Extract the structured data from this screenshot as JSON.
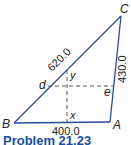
{
  "diagram": {
    "vertices": {
      "A": {
        "label": "A"
      },
      "B": {
        "label": "B"
      },
      "C": {
        "label": "C"
      }
    },
    "points": {
      "d": {
        "label": "d"
      },
      "e": {
        "label": "e"
      },
      "x": {
        "label": "x"
      },
      "y": {
        "label": "y"
      }
    },
    "sides": {
      "BC": {
        "length": "620.0"
      },
      "CA": {
        "length": "430.0"
      },
      "BA": {
        "length": "400.0"
      }
    },
    "colors": {
      "line": "#2a4a9a",
      "dashed": "#555555",
      "caption": "#1a4fa0"
    }
  },
  "caption": {
    "text": "Problem 21.23"
  }
}
